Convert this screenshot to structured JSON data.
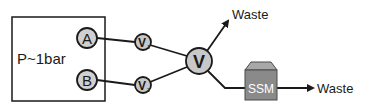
{
  "diagram": {
    "pressure_box": {
      "label": "P~1bar"
    },
    "inputs": [
      {
        "id": "A",
        "label": "A"
      },
      {
        "id": "B",
        "label": "B"
      }
    ],
    "valves": [
      {
        "id": "V1",
        "label": "V",
        "subscript": "1"
      },
      {
        "id": "V2",
        "label": "V",
        "subscript": "2"
      }
    ],
    "main_valve": {
      "label": "V"
    },
    "outputs": {
      "waste_top": {
        "label": "Waste"
      },
      "ssm": {
        "label": "SSM"
      },
      "waste_right": {
        "label": "Waste"
      }
    },
    "colors": {
      "node_fill": "#c8c8c8",
      "stroke": "#1a1a1a",
      "ssm_front": "#8a8a8a",
      "ssm_top": "#a8a8a8",
      "ssm_text": "#ffffff"
    }
  }
}
